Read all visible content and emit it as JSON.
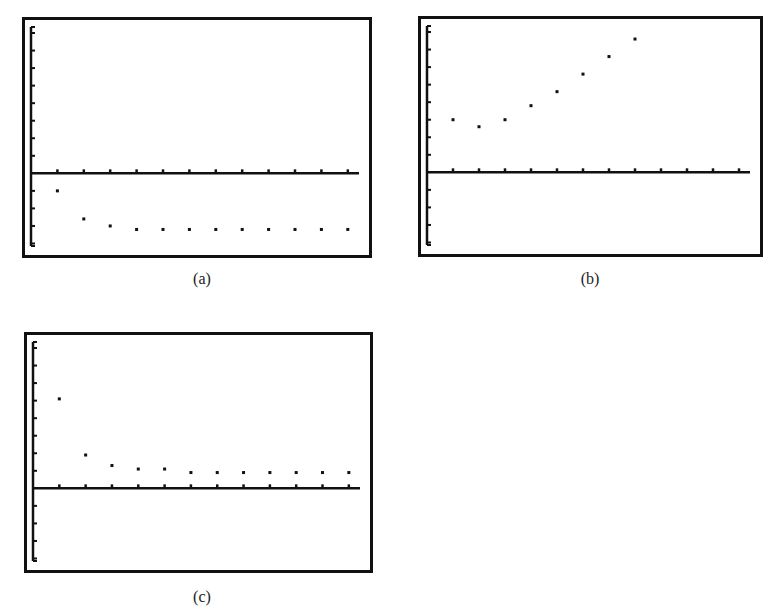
{
  "chart_data": [
    {
      "id": "a",
      "type": "scatter",
      "title": "",
      "caption": "(a)",
      "xlabel": "",
      "ylabel": "",
      "grid": false,
      "xlim": [
        0,
        12.5
      ],
      "ylim": [
        -4.2,
        8.4
      ],
      "x_ticks": [
        1,
        2,
        3,
        4,
        5,
        6,
        7,
        8,
        9,
        10,
        11,
        12
      ],
      "y_ticks": [
        -4,
        -3,
        -2,
        -1,
        1,
        2,
        3,
        4,
        5,
        6,
        7,
        8
      ],
      "x": [
        1,
        2,
        3,
        4,
        5,
        6,
        7,
        8,
        9,
        10,
        11,
        12
      ],
      "y": [
        -1.0,
        -2.6,
        -3.0,
        -3.2,
        -3.2,
        -3.2,
        -3.2,
        -3.2,
        -3.2,
        -3.2,
        -3.2,
        -3.2
      ],
      "frame": {
        "left": 22,
        "top": 17,
        "width": 350,
        "height": 241
      },
      "caption_pos": {
        "x": 172,
        "y": 270
      }
    },
    {
      "id": "b",
      "type": "scatter",
      "title": "",
      "caption": "(b)",
      "xlabel": "",
      "ylabel": "",
      "grid": false,
      "xlim": [
        0,
        12.5
      ],
      "ylim": [
        -4.2,
        8.4
      ],
      "x_ticks": [
        1,
        2,
        3,
        4,
        5,
        6,
        7,
        8,
        9,
        10,
        11,
        12
      ],
      "y_ticks": [
        -4,
        -3,
        -2,
        -1,
        1,
        2,
        3,
        4,
        5,
        6,
        7,
        8
      ],
      "x": [
        1,
        2,
        3,
        4,
        5,
        6,
        7,
        8
      ],
      "y": [
        3.0,
        2.6,
        3.0,
        3.8,
        4.6,
        5.6,
        6.6,
        7.6
      ],
      "frame": {
        "left": 418,
        "top": 16,
        "width": 345,
        "height": 241
      },
      "caption_pos": {
        "x": 560,
        "y": 270
      }
    },
    {
      "id": "c",
      "type": "scatter",
      "title": "",
      "caption": "(c)",
      "xlabel": "",
      "ylabel": "",
      "grid": false,
      "xlim": [
        0,
        12.5
      ],
      "ylim": [
        -4.2,
        8.4
      ],
      "x_ticks": [
        1,
        2,
        3,
        4,
        5,
        6,
        7,
        8,
        9,
        10,
        11,
        12
      ],
      "y_ticks": [
        -4,
        -3,
        -2,
        -1,
        1,
        2,
        3,
        4,
        5,
        6,
        7,
        8
      ],
      "x": [
        1,
        2,
        3,
        4,
        5,
        6,
        7,
        8,
        9,
        10,
        11,
        12
      ],
      "y": [
        5.1,
        1.9,
        1.3,
        1.1,
        1.1,
        0.9,
        0.9,
        0.9,
        0.9,
        0.9,
        0.9,
        0.9
      ],
      "frame": {
        "left": 24,
        "top": 332,
        "width": 349,
        "height": 241
      },
      "caption_pos": {
        "x": 172,
        "y": 588
      }
    }
  ]
}
